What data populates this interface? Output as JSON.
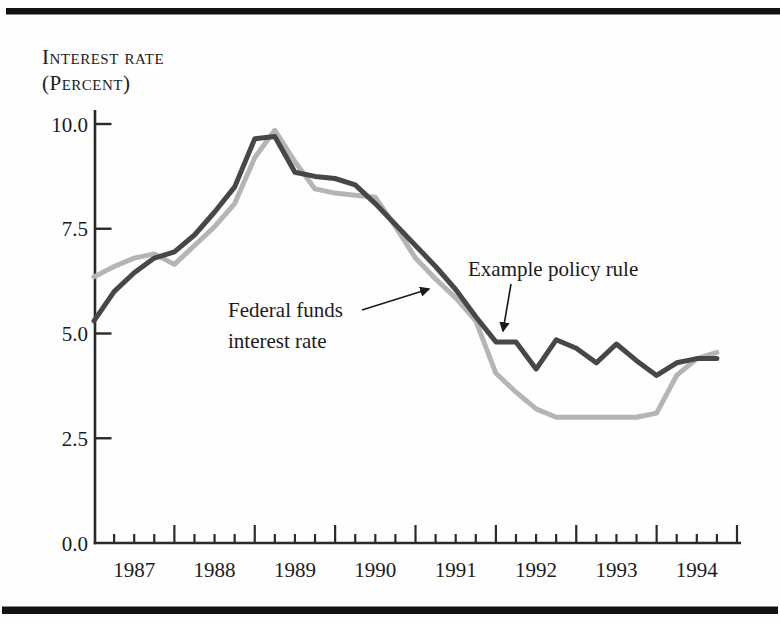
{
  "figure": {
    "title_line1": "Interest rate",
    "title_line2": "(Percent)",
    "frame_color": "#121212",
    "background": "#fefefe"
  },
  "chart_data": {
    "type": "line",
    "title": "Interest rate (Percent)",
    "xlabel": "",
    "ylabel": "Interest rate (Percent)",
    "x_unit": "quarter",
    "x_range_years": [
      1987,
      1994
    ],
    "x_tick_year_labels": [
      "1987",
      "1988",
      "1989",
      "1990",
      "1991",
      "1992",
      "1993",
      "1994"
    ],
    "quarters_per_year": 4,
    "ylim": [
      0.0,
      10.0
    ],
    "y_tick_labels": [
      "10.0",
      "7.5",
      "5.0",
      "2.5",
      "0.0"
    ],
    "y_tick_values": [
      10.0,
      7.5,
      5.0,
      2.5,
      0.0
    ],
    "grid": false,
    "legend_position": "inline-annotations",
    "axis_color": "#2a2a2a",
    "series": [
      {
        "name": "Federal funds interest rate",
        "color": "#b5b5b5",
        "stroke_width": 5,
        "values": [
          6.35,
          6.6,
          6.8,
          6.9,
          6.65,
          7.1,
          7.55,
          8.1,
          9.2,
          9.85,
          9.1,
          8.45,
          8.35,
          8.3,
          8.25,
          7.55,
          6.8,
          6.3,
          5.85,
          5.3,
          4.05,
          3.6,
          3.2,
          3.0,
          3.0,
          3.0,
          3.0,
          3.0,
          3.1,
          4.0,
          4.4,
          4.55
        ]
      },
      {
        "name": "Example policy rule",
        "color": "#474747",
        "stroke_width": 5,
        "values": [
          5.3,
          6.0,
          6.45,
          6.8,
          6.95,
          7.35,
          7.9,
          8.5,
          9.65,
          9.7,
          8.85,
          8.75,
          8.7,
          8.55,
          8.1,
          7.6,
          7.1,
          6.6,
          6.05,
          5.4,
          4.8,
          4.8,
          4.15,
          4.85,
          4.65,
          4.3,
          4.75,
          4.35,
          4.0,
          4.3,
          4.4,
          4.4
        ]
      }
    ],
    "annotations": [
      {
        "id": "federal-funds-label",
        "lines": [
          "Federal funds",
          "interest rate"
        ],
        "text_x": 228,
        "text_y": 317,
        "line_height": 31,
        "arrow": {
          "x1": 362,
          "y1": 310,
          "x2": 429,
          "y2": 289
        }
      },
      {
        "id": "example-policy-rule-label",
        "lines": [
          "Example policy rule"
        ],
        "text_x": 468,
        "text_y": 276,
        "line_height": 31,
        "arrow": {
          "x1": 511,
          "y1": 284,
          "x2": 503,
          "y2": 331
        }
      }
    ]
  }
}
